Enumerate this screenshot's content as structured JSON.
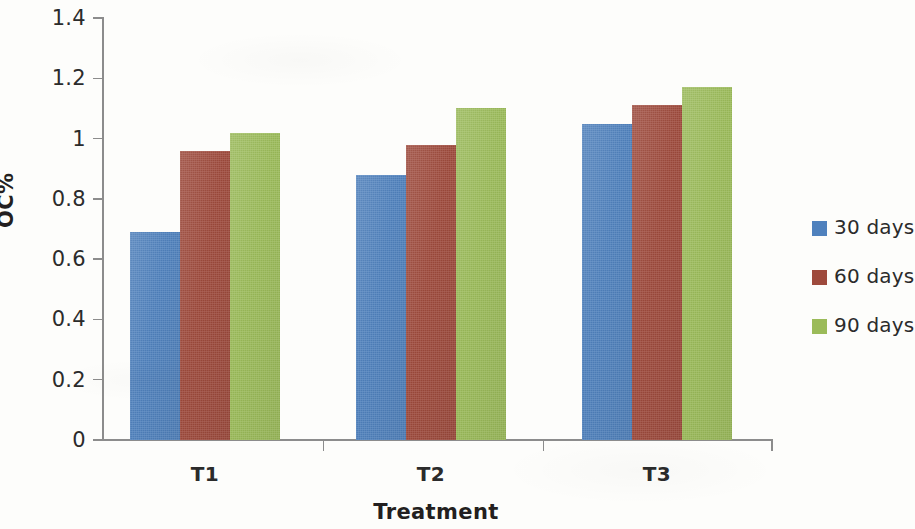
{
  "chart_data": {
    "type": "bar",
    "title": "",
    "subtitle": "",
    "xlabel": "Treatment",
    "ylabel": "OC%",
    "categories": [
      "T1",
      "T2",
      "T3"
    ],
    "series": [
      {
        "name": "30 days",
        "color": "#4f81bd",
        "values": [
          0.69,
          0.88,
          1.05
        ]
      },
      {
        "name": "60 days",
        "color": "#9e4a3c",
        "values": [
          0.96,
          0.98,
          1.11
        ]
      },
      {
        "name": "90 days",
        "color": "#9bbb59",
        "values": [
          1.02,
          1.1,
          1.17
        ]
      }
    ],
    "ylim": [
      0,
      1.4
    ],
    "ytick_values": [
      0,
      0.2,
      0.4,
      0.6,
      0.8,
      1.0,
      1.2,
      1.4
    ],
    "ytick_labels": [
      "0",
      "0.2",
      "0.4",
      "0.6",
      "0.8",
      "1",
      "1.2",
      "1.4"
    ],
    "grid": false,
    "legend_position": "right",
    "orientation": "vertical",
    "grouping": "clustered"
  },
  "axis": {
    "y_title": "OC%",
    "x_title": "Treatment"
  },
  "legend": {
    "entries": [
      {
        "label": "30 days",
        "color": "#4f81bd"
      },
      {
        "label": "60 days",
        "color": "#9e4a3c"
      },
      {
        "label": "90 days",
        "color": "#9bbb59"
      }
    ]
  }
}
